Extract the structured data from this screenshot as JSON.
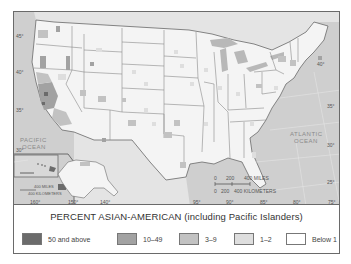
{
  "map": {
    "title": "PERCENT ASIAN-AMERICAN (including Pacific Islanders)",
    "ocean_labels": {
      "pacific": [
        "PACIFIC",
        "OCEAN"
      ],
      "atlantic": [
        "ATLANTIC",
        "OCEAN"
      ]
    },
    "latitude_labels_left": [
      "45°",
      "40°",
      "35°",
      "30°"
    ],
    "latitude_labels_right": [
      "40°",
      "35°",
      "30°",
      "25°"
    ],
    "longitude_labels": [
      "160°",
      "150°",
      "140°",
      "95°",
      "90°",
      "85°",
      "80°",
      "75°"
    ],
    "scale_bar": {
      "miles_ticks": [
        "0",
        "200",
        "400 MILES"
      ],
      "km_ticks": [
        "0",
        "200",
        "400 KILOMETERS"
      ]
    },
    "inset_scale": {
      "miles": "400 MILES",
      "km": "400 KILOMETERS"
    },
    "colors": {
      "ocean": "#cfcfcf",
      "land": "#f4f4f4",
      "border": "#8a8a8a",
      "frame": "#6a6a6a"
    }
  },
  "legend": {
    "title": "PERCENT ASIAN-AMERICAN (including Pacific Islanders)",
    "items": [
      {
        "label": "50 and above",
        "color": "#6b6b6b"
      },
      {
        "label": "10–49",
        "color": "#a2a2a2"
      },
      {
        "label": "3–9",
        "color": "#c2c2c2"
      },
      {
        "label": "1–2",
        "color": "#dedede"
      },
      {
        "label": "Below 1",
        "color": "#ffffff"
      }
    ]
  }
}
